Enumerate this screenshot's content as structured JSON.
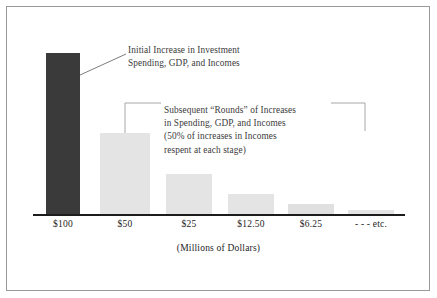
{
  "figure": {
    "axis_caption": "(Millions of Dollars)",
    "frame_color": "#9a9a9a",
    "background": "#ffffff"
  },
  "annotations": {
    "callout1": {
      "line1": "Initial Increase in Investment",
      "line2": "Spending, GDP, and Incomes"
    },
    "callout2": {
      "line1": "Subsequent “Rounds” of Increases",
      "line2": "in Spending, GDP, and Incomes",
      "line3": "(50% of increases in Incomes",
      "line4": "respent at each stage)"
    }
  },
  "chart_data": {
    "type": "bar",
    "title": "",
    "xlabel": "(Millions of Dollars)",
    "ylabel": "",
    "grid": false,
    "legend": "none",
    "categories": [
      "$100",
      "$50",
      "$25",
      "$12.50",
      "$6.25",
      "- - - etc."
    ],
    "values": [
      100,
      50,
      25,
      12.5,
      6.25,
      2
    ],
    "ylim": [
      0,
      100
    ],
    "bar_colors": [
      "#3a3a3a",
      "#e4e4e4",
      "#e4e4e4",
      "#e4e4e4",
      "#e4e4e4",
      "#e4e4e4"
    ],
    "bars": [
      {
        "label": "$100",
        "value": 100,
        "x": 46,
        "width": 34,
        "height": 162,
        "color": "#3a3a3a"
      },
      {
        "label": "$50",
        "value": 50,
        "x": 100,
        "width": 50,
        "height": 82,
        "color": "#e4e4e4"
      },
      {
        "label": "$25",
        "value": 25,
        "x": 166,
        "width": 46,
        "height": 41,
        "color": "#e4e4e4"
      },
      {
        "label": "$12.50",
        "value": 12.5,
        "x": 228,
        "width": 46,
        "height": 21,
        "color": "#e4e4e4"
      },
      {
        "label": "$6.25",
        "value": 6.25,
        "x": 288,
        "width": 46,
        "height": 11,
        "color": "#e0e0e0"
      },
      {
        "label": "- - - etc.",
        "value": 2,
        "x": 348,
        "width": 46,
        "height": 5,
        "color": "#e4e4e4"
      }
    ]
  }
}
